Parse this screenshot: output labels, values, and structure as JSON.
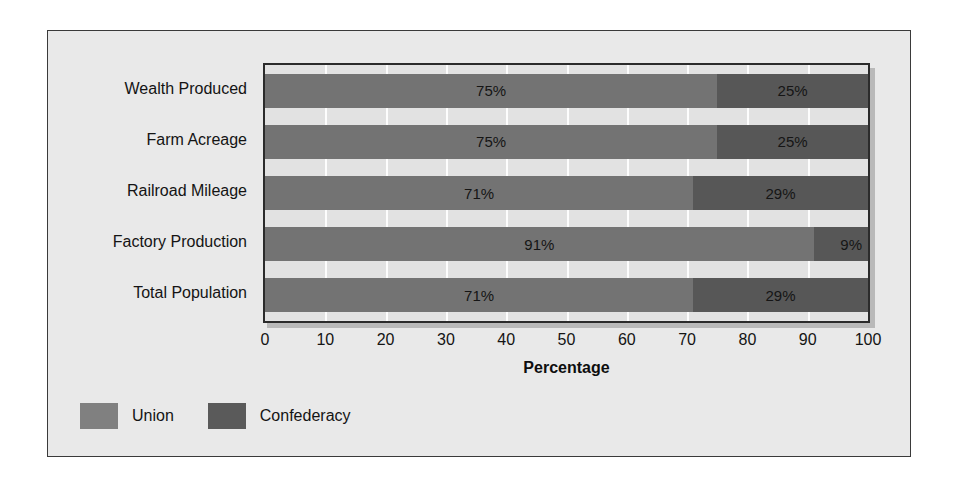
{
  "chart_data": {
    "type": "bar",
    "orientation": "horizontal",
    "stacked": true,
    "stacked_normalized": true,
    "title": "",
    "xlabel": "Percentage",
    "ylabel": "",
    "xlim": [
      0,
      100
    ],
    "xticks": [
      "0",
      "10",
      "20",
      "30",
      "40",
      "50",
      "60",
      "70",
      "80",
      "90",
      "100"
    ],
    "xtick_step": 10,
    "grid": "vertical-white-gridlines",
    "legend_position": "bottom-left",
    "categories": [
      "Wealth Produced",
      "Farm Acreage",
      "Railroad Mileage",
      "Factory Production",
      "Total Population"
    ],
    "series": [
      {
        "name": "Union",
        "color": "#737373",
        "values": [
          75,
          75,
          71,
          91,
          71
        ],
        "labels": [
          "75%",
          "75%",
          "71%",
          "91%",
          "71%"
        ]
      },
      {
        "name": "Confederacy",
        "color": "#575757",
        "values": [
          25,
          25,
          29,
          9,
          29
        ],
        "labels": [
          "25%",
          "25%",
          "29%",
          "9%",
          "29%"
        ]
      }
    ]
  },
  "legend": {
    "items": [
      {
        "label": "Union",
        "color": "#808080"
      },
      {
        "label": "Confederacy",
        "color": "#5a5a5a"
      }
    ]
  },
  "colors": {
    "page_background": "#ffffff",
    "card_background": "#e9e9e9",
    "card_border": "#3a3a3a",
    "plot_background": "#e2e2e2",
    "plot_border": "#2b2b2b",
    "gridline": "#fdfdfd",
    "union": "#737373",
    "confederacy": "#575757",
    "text": "#141414"
  }
}
